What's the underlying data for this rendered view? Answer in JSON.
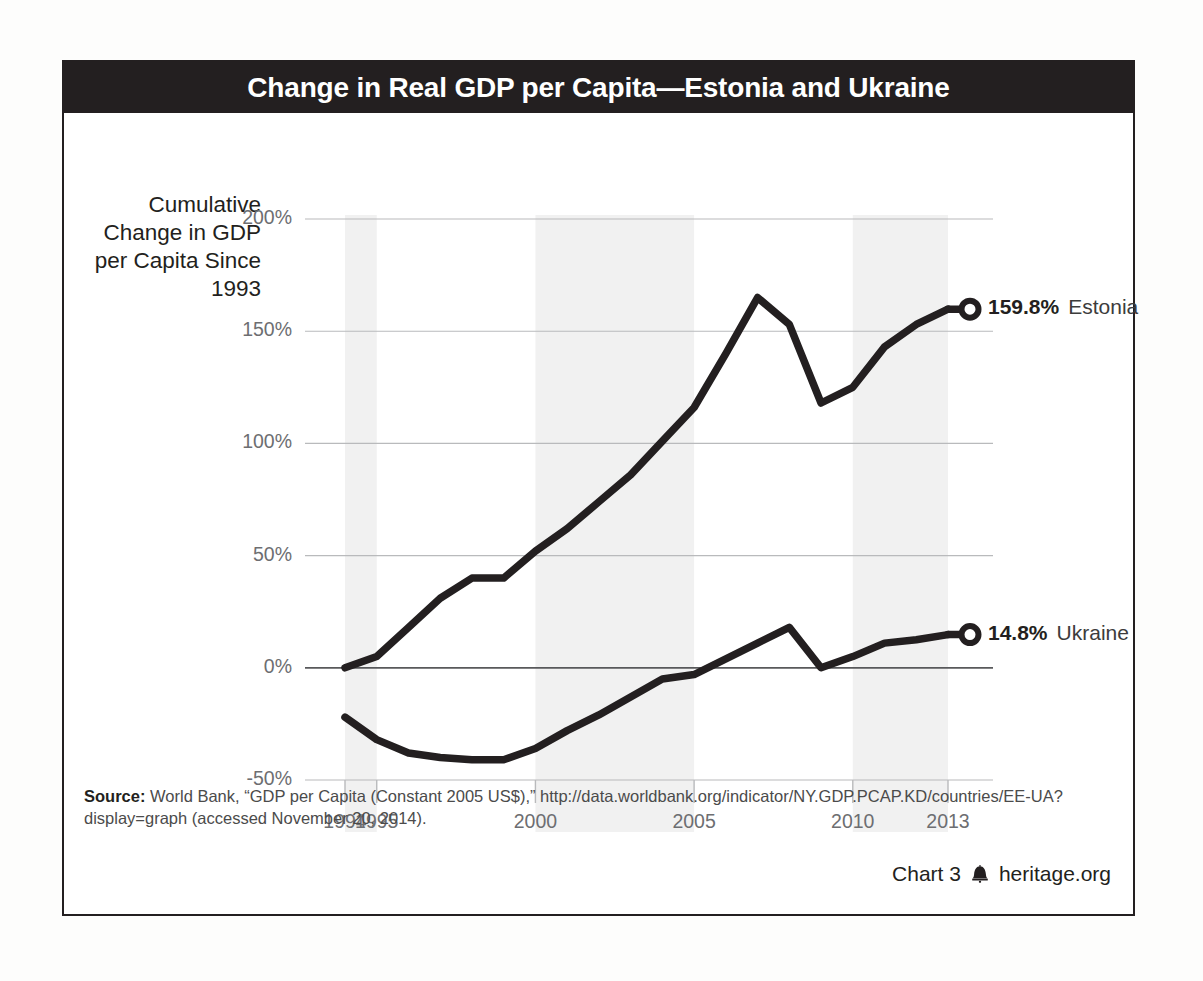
{
  "chart_title": "Change in Real GDP per Capita—Estonia and Ukraine",
  "y_axis_caption": "Cumulative Change in GDP per Capita Since 1993",
  "source": {
    "label": "Source:",
    "text": " World Bank, “GDP per Capita (Constant 2005 US$),” http://data.worldbank.org/indicator/NY.GDP.PCAP.KD/countries/EE-UA?display=graph (accessed November 20, 2014)."
  },
  "footer": {
    "chart_number": "Chart 3",
    "bell_icon": "liberty-bell-icon",
    "site": "heritage.org"
  },
  "colors": {
    "title_bar": "#231f20",
    "series_line": "#231f20",
    "gridline": "#b9babc",
    "zero_line": "#58595b",
    "band": "#f1f1f1",
    "tick_text": "#6d6e71"
  },
  "chart_data": {
    "type": "line",
    "title": "Change in Real GDP per Capita—Estonia and Ukraine",
    "xlabel": "",
    "ylabel": "Cumulative Change in GDP per Capita Since 1993",
    "xlim": [
      1994,
      2013
    ],
    "ylim": [
      -50,
      200
    ],
    "yticks": [
      200,
      150,
      100,
      50,
      0,
      -50
    ],
    "ytick_labels": [
      "200%",
      "150%",
      "100%",
      "50%",
      "0%",
      "-50%"
    ],
    "xticks": [
      1994,
      1995,
      2000,
      2005,
      2010,
      2013
    ],
    "xtick_labels": [
      "1994",
      "1995",
      "2000",
      "2005",
      "2010",
      "2013"
    ],
    "grid": true,
    "legend": "end-of-line labels",
    "shaded_bands": [
      [
        1994,
        1995
      ],
      [
        2000,
        2005
      ],
      [
        2010,
        2013
      ]
    ],
    "x": [
      1994,
      1995,
      1996,
      1997,
      1998,
      1999,
      2000,
      2001,
      2002,
      2003,
      2004,
      2005,
      2006,
      2007,
      2008,
      2009,
      2010,
      2011,
      2012,
      2013
    ],
    "series": [
      {
        "name": "Estonia",
        "end_value_label": "159.8%",
        "end_marker": "open-circle",
        "values": [
          0.0,
          5.0,
          18.0,
          31.0,
          40.0,
          40.0,
          52.0,
          62.0,
          74.0,
          86.0,
          101.0,
          116.0,
          140.0,
          165.0,
          153.0,
          118.0,
          125.0,
          143.0,
          153.0,
          159.8
        ]
      },
      {
        "name": "Ukraine",
        "end_value_label": "14.8%",
        "end_marker": "open-circle",
        "values": [
          -22.0,
          -32.0,
          -38.0,
          -40.0,
          -41.0,
          -41.0,
          -36.0,
          -28.0,
          -21.0,
          -13.0,
          -5.0,
          -3.0,
          4.0,
          11.0,
          18.0,
          0.0,
          5.0,
          11.0,
          12.5,
          14.8
        ]
      }
    ]
  }
}
